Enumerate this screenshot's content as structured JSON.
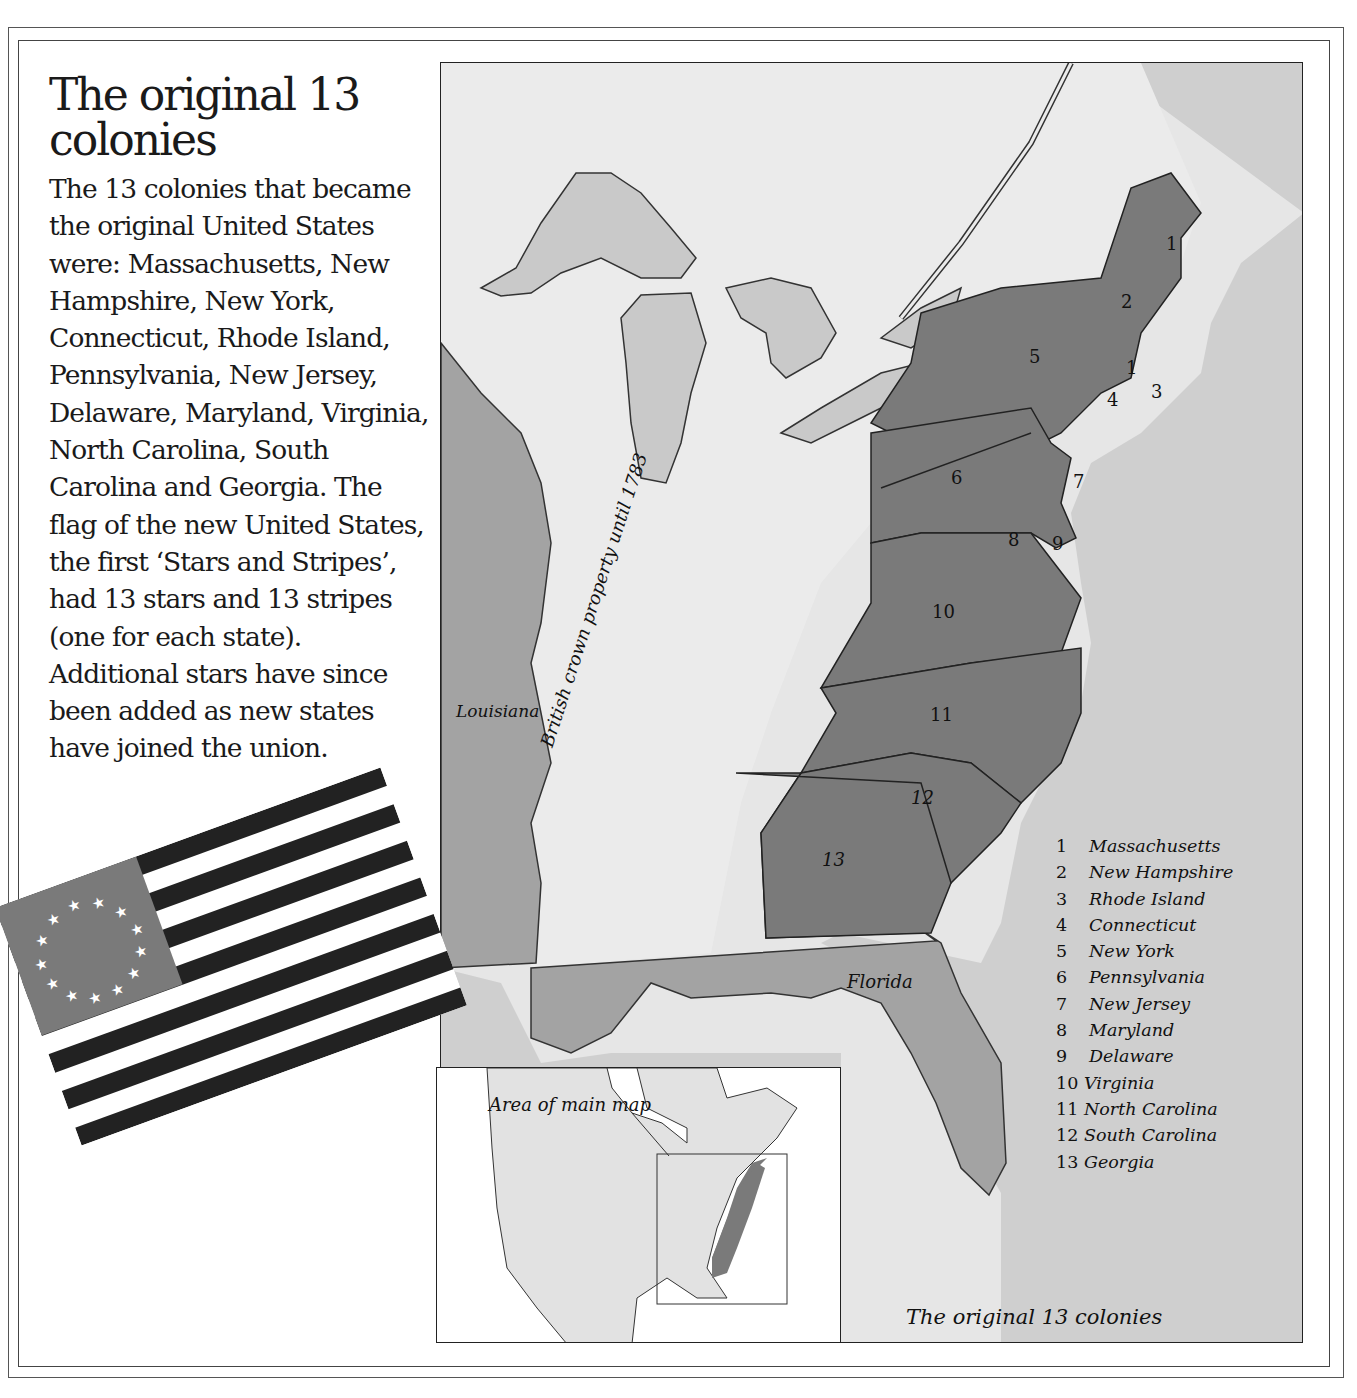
{
  "page": {
    "title": "The original 13 colonies",
    "body": "The 13 colonies that became the original United States were: Massachusetts, New Hampshire, New York, Connecticut, Rhode Island, Pennsylvania, New Jersey, Delaware, Maryland, Virginia, North Carolina, South Carolina and Georgia. The flag of the new United States, the first ‘Stars and Stripes’, had 13 stars and 13 stripes (one for each state). Additional stars have since been added as new states have joined the union."
  },
  "map": {
    "caption": "The original 13 colonies",
    "region_labels": {
      "louisiana": "Louisiana",
      "british_crown": "British crown property until 1783",
      "florida": "Florida"
    },
    "colony_numbers": {
      "ma_north": "1",
      "nh": "2",
      "ma": "1",
      "ri": "3",
      "ct": "4",
      "ny": "5",
      "pa": "6",
      "nj": "7",
      "md": "8",
      "de": "9",
      "va": "10",
      "nc": "11",
      "sc": "12",
      "ga": "13"
    },
    "legend": [
      {
        "num": "1",
        "name": "Massachusetts"
      },
      {
        "num": "2",
        "name": "New Hampshire"
      },
      {
        "num": "3",
        "name": "Rhode Island"
      },
      {
        "num": "4",
        "name": "Connecticut"
      },
      {
        "num": "5",
        "name": "New York"
      },
      {
        "num": "6",
        "name": "Pennsylvania"
      },
      {
        "num": "7",
        "name": "New Jersey"
      },
      {
        "num": "8",
        "name": "Maryland"
      },
      {
        "num": "9",
        "name": "Delaware"
      },
      {
        "num": "10",
        "name": "Virginia"
      },
      {
        "num": "11",
        "name": "North Carolina"
      },
      {
        "num": "12",
        "name": "South Carolina"
      },
      {
        "num": "13",
        "name": "Georgia"
      }
    ],
    "colors": {
      "colonies": "#7a7a7a",
      "louisiana_florida": "#a3a3a3",
      "land_unclaimed": "#ebebeb",
      "lakes": "#c9c9c9",
      "ocean": "#cfcfcf"
    }
  },
  "inset": {
    "label": "Area of main map"
  },
  "flag": {
    "stars": 13,
    "stripes": 13,
    "canton_color": "#7a7a7a",
    "stripe_dark": "#222222",
    "stripe_light": "#ffffff"
  }
}
